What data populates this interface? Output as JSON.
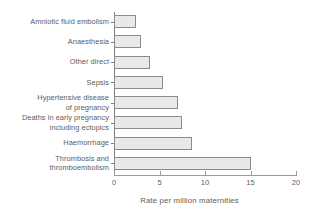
{
  "chart_data": {
    "type": "bar",
    "orientation": "horizontal",
    "title": "",
    "xlabel": "Rate per million maternities",
    "ylabel": "",
    "xlim": [
      0,
      20
    ],
    "xticks": [
      0,
      5,
      10,
      15,
      20
    ],
    "xtick_labels": [
      "0",
      "5",
      "10",
      "15",
      "20"
    ],
    "grid": false,
    "legend": null,
    "bar_fill_color": "#e9e9e9",
    "bar_border_color": "#8b8b8b",
    "text_color": "#5d5d5d",
    "axis_color": "#9a9a9a",
    "categories": [
      "Amniotic fluid embolism",
      "Anaesthesia",
      "Other direct",
      "Sepsis",
      "Hypertensive disease\nof pregnancy",
      "Deaths in early pregnancy\nincluding ectopics",
      "Haemorrhage",
      "Thrombosis and\nthromboembolism"
    ],
    "values": [
      2.4,
      3.0,
      4.0,
      5.4,
      7.0,
      7.5,
      8.6,
      15.0
    ]
  }
}
